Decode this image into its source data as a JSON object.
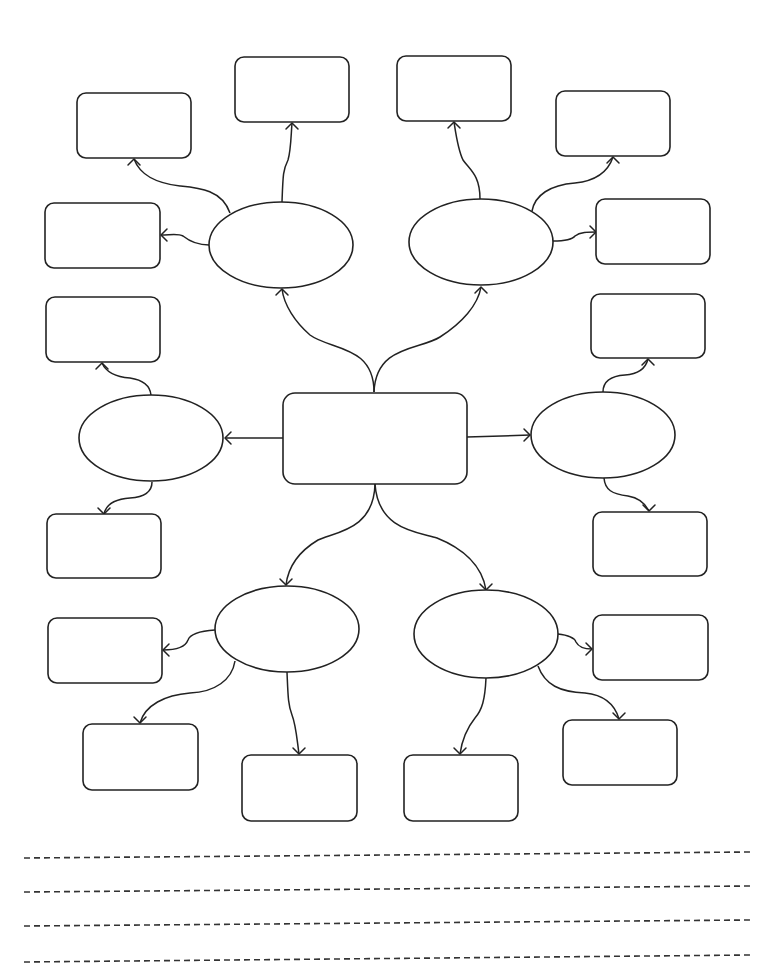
{
  "diagram": {
    "type": "mind-map",
    "stroke_color": "#222222",
    "background": "#ffffff",
    "center_box": {
      "id": "center",
      "x": 283,
      "y": 393,
      "w": 184,
      "h": 91,
      "r": 12,
      "text": ""
    },
    "ellipses": [
      {
        "id": "e_top_left",
        "cx": 281,
        "cy": 245,
        "rx": 72,
        "ry": 43,
        "text": ""
      },
      {
        "id": "e_top_right",
        "cx": 481,
        "cy": 242,
        "rx": 72,
        "ry": 43,
        "text": ""
      },
      {
        "id": "e_mid_left",
        "cx": 151,
        "cy": 438,
        "rx": 72,
        "ry": 43,
        "text": ""
      },
      {
        "id": "e_mid_right",
        "cx": 603,
        "cy": 435,
        "rx": 72,
        "ry": 43,
        "text": ""
      },
      {
        "id": "e_bot_left",
        "cx": 287,
        "cy": 629,
        "rx": 72,
        "ry": 43,
        "text": ""
      },
      {
        "id": "e_bot_right",
        "cx": 486,
        "cy": 634,
        "rx": 72,
        "ry": 44,
        "text": ""
      }
    ],
    "boxes": [
      {
        "id": "b_tl_upper",
        "x": 77,
        "y": 93,
        "w": 114,
        "h": 65,
        "r": 9,
        "text": ""
      },
      {
        "id": "b_tl_top",
        "x": 235,
        "y": 57,
        "w": 114,
        "h": 65,
        "r": 9,
        "text": ""
      },
      {
        "id": "b_tl_side",
        "x": 45,
        "y": 203,
        "w": 115,
        "h": 65,
        "r": 9,
        "text": ""
      },
      {
        "id": "b_tr_top",
        "x": 397,
        "y": 56,
        "w": 114,
        "h": 65,
        "r": 9,
        "text": ""
      },
      {
        "id": "b_tr_upper",
        "x": 556,
        "y": 91,
        "w": 114,
        "h": 65,
        "r": 9,
        "text": ""
      },
      {
        "id": "b_tr_side",
        "x": 596,
        "y": 199,
        "w": 114,
        "h": 65,
        "r": 9,
        "text": ""
      },
      {
        "id": "b_ml_top",
        "x": 46,
        "y": 297,
        "w": 114,
        "h": 65,
        "r": 9,
        "text": ""
      },
      {
        "id": "b_ml_bottom",
        "x": 47,
        "y": 514,
        "w": 114,
        "h": 64,
        "r": 9,
        "text": ""
      },
      {
        "id": "b_mr_top",
        "x": 591,
        "y": 294,
        "w": 114,
        "h": 64,
        "r": 9,
        "text": ""
      },
      {
        "id": "b_mr_bottom",
        "x": 593,
        "y": 512,
        "w": 114,
        "h": 64,
        "r": 9,
        "text": ""
      },
      {
        "id": "b_bl_side",
        "x": 48,
        "y": 618,
        "w": 114,
        "h": 65,
        "r": 9,
        "text": ""
      },
      {
        "id": "b_bl_lower",
        "x": 83,
        "y": 724,
        "w": 115,
        "h": 66,
        "r": 9,
        "text": ""
      },
      {
        "id": "b_bl_bottom",
        "x": 242,
        "y": 755,
        "w": 115,
        "h": 66,
        "r": 9,
        "text": ""
      },
      {
        "id": "b_br_side",
        "x": 593,
        "y": 615,
        "w": 115,
        "h": 65,
        "r": 9,
        "text": ""
      },
      {
        "id": "b_br_lower",
        "x": 563,
        "y": 720,
        "w": 114,
        "h": 65,
        "r": 9,
        "text": ""
      },
      {
        "id": "b_br_bottom",
        "x": 404,
        "y": 755,
        "w": 114,
        "h": 66,
        "r": 9,
        "text": ""
      }
    ],
    "connectors": [
      {
        "from": "center",
        "to": "e_top_left",
        "d": "M374,392 C374,345 330,350 310,335 C295,322 284,305 282,289",
        "tip": [
          282,
          289
        ],
        "dir": "up"
      },
      {
        "from": "center",
        "to": "e_top_right",
        "d": "M374,392 C376,345 420,350 440,337 C462,323 478,305 481,287",
        "tip": [
          481,
          287
        ],
        "dir": "up"
      },
      {
        "from": "center",
        "to": "e_bot_left",
        "d": "M375,484 C374,530 335,532 318,540 C298,552 288,568 286,585",
        "tip": [
          286,
          585
        ],
        "dir": "down"
      },
      {
        "from": "center",
        "to": "e_bot_right",
        "d": "M375,484 C378,530 418,532 437,538 C462,548 482,565 486,590",
        "tip": [
          486,
          590
        ],
        "dir": "down"
      },
      {
        "from": "center",
        "to": "e_mid_left",
        "d": "M283,438 L225,438",
        "tip": [
          225,
          438
        ],
        "dir": "left"
      },
      {
        "from": "center",
        "to": "e_mid_right",
        "d": "M467,437 L530,435",
        "tip": [
          530,
          435
        ],
        "dir": "right"
      },
      {
        "from": "e_top_left",
        "to": "b_tl_upper",
        "d": "M230,213 C222,190 200,188 180,186 C155,183 140,175 134,159",
        "tip": [
          134,
          159
        ],
        "dir": "up"
      },
      {
        "from": "e_top_left",
        "to": "b_tl_top",
        "d": "M282,202 C283,175 283,170 288,160 C291,150 291,135 292,123",
        "tip": [
          292,
          123
        ],
        "dir": "up"
      },
      {
        "from": "e_top_left",
        "to": "b_tl_side",
        "d": "M209,245 C195,245 188,240 183,236 C178,233 170,235 161,235",
        "tip": [
          161,
          235
        ],
        "dir": "left"
      },
      {
        "from": "e_top_right",
        "to": "b_tr_top",
        "d": "M480,199 C480,175 470,170 463,160 C458,150 456,135 454,122",
        "tip": [
          454,
          122
        ],
        "dir": "up"
      },
      {
        "from": "e_top_right",
        "to": "b_tr_upper",
        "d": "M532,211 C535,195 550,185 575,183 C595,181 608,172 613,157",
        "tip": [
          613,
          157
        ],
        "dir": "up"
      },
      {
        "from": "e_top_right",
        "to": "b_tr_side",
        "d": "M553,241 C565,241 572,240 575,236 C580,232 588,232 596,232",
        "tip": [
          596,
          232
        ],
        "dir": "right"
      },
      {
        "from": "e_mid_left",
        "to": "b_ml_top",
        "d": "M151,395 C150,385 143,380 130,378 C115,377 106,372 102,363",
        "tip": [
          102,
          363
        ],
        "dir": "up"
      },
      {
        "from": "e_mid_left",
        "to": "b_ml_bottom",
        "d": "M152,482 C152,492 145,497 130,498 C115,499 106,505 104,514",
        "tip": [
          104,
          514
        ],
        "dir": "down"
      },
      {
        "from": "e_mid_right",
        "to": "b_mr_top",
        "d": "M603,392 C603,382 610,376 625,375 C640,374 646,367 648,359",
        "tip": [
          648,
          359
        ],
        "dir": "up"
      },
      {
        "from": "e_mid_right",
        "to": "b_mr_bottom",
        "d": "M604,478 C605,490 612,494 628,496 C640,498 646,505 649,511",
        "tip": [
          649,
          511
        ],
        "dir": "down"
      },
      {
        "from": "e_bot_left",
        "to": "b_bl_side",
        "d": "M215,630 C200,631 190,634 188,640 C185,648 175,650 163,650",
        "tip": [
          163,
          650
        ],
        "dir": "left"
      },
      {
        "from": "e_bot_left",
        "to": "b_bl_lower",
        "d": "M235,661 C232,680 215,692 190,693 C165,695 145,705 140,723",
        "tip": [
          140,
          723
        ],
        "dir": "down"
      },
      {
        "from": "e_bot_left",
        "to": "b_bl_bottom",
        "d": "M287,672 C288,695 288,705 292,715 C296,725 297,740 299,754",
        "tip": [
          299,
          754
        ],
        "dir": "down"
      },
      {
        "from": "e_bot_right",
        "to": "b_br_side",
        "d": "M558,634 C568,635 574,637 576,642 C579,648 585,649 592,649",
        "tip": [
          592,
          649
        ],
        "dir": "right"
      },
      {
        "from": "e_bot_right",
        "to": "b_br_lower",
        "d": "M538,666 C545,685 560,692 585,693 C605,695 615,705 619,719",
        "tip": [
          619,
          719
        ],
        "dir": "down"
      },
      {
        "from": "e_bot_right",
        "to": "b_br_bottom",
        "d": "M486,678 C485,700 482,710 475,718 C467,728 462,740 460,754",
        "tip": [
          460,
          754
        ],
        "dir": "down"
      }
    ],
    "writing_lines": [
      {
        "x1": 24,
        "y1": 858,
        "x2": 750,
        "y2": 852
      },
      {
        "x1": 24,
        "y1": 892,
        "x2": 750,
        "y2": 886
      },
      {
        "x1": 24,
        "y1": 926,
        "x2": 750,
        "y2": 920
      },
      {
        "x1": 24,
        "y1": 962,
        "x2": 750,
        "y2": 955
      }
    ]
  }
}
